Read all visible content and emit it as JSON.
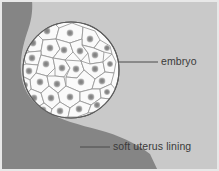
{
  "figure": {
    "background_color": "#c9c9c9",
    "border_color": "#e8e8e8"
  },
  "labels": {
    "embryo": "embryo",
    "uterus_lining": "soft uterus lining"
  },
  "structures": {
    "embryo": {
      "name": "embryo",
      "shape": "circle",
      "fill_color": "#fbfbfb",
      "outline_color": "#5a5a5a",
      "center_x": 71,
      "center_y": 70,
      "radius": 48,
      "cell_count": 30,
      "cell_fill_color": "#fafafa",
      "cell_outline_color": "#8e8e8e",
      "nucleus_color": "#8a8a8a"
    },
    "uterus_lining": {
      "name": "soft uterus lining",
      "fill_color": "#858585",
      "description": "dark gray tissue band along left edge sweeping to lower right"
    }
  },
  "leader_lines": {
    "embryo": {
      "color": "#4a4a4a",
      "x1": 118,
      "y1": 62,
      "x2": 158,
      "y2": 62
    },
    "uterus_lining": {
      "color": "#4a4a4a",
      "x1": 80,
      "y1": 147,
      "x2": 110,
      "y2": 147
    }
  }
}
